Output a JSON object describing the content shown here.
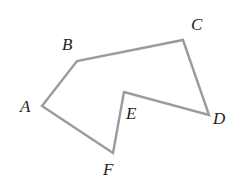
{
  "figure": {
    "type": "polygon",
    "vertex_order": [
      "A",
      "B",
      "C",
      "D",
      "E",
      "F"
    ],
    "vertices": [
      {
        "id": "A",
        "label": "A"
      },
      {
        "id": "B",
        "label": "B"
      },
      {
        "id": "C",
        "label": "C"
      },
      {
        "id": "D",
        "label": "D"
      },
      {
        "id": "E",
        "label": "E"
      },
      {
        "id": "F",
        "label": "F"
      }
    ],
    "edges": [
      [
        "A",
        "B"
      ],
      [
        "B",
        "C"
      ],
      [
        "C",
        "D"
      ],
      [
        "D",
        "E"
      ],
      [
        "E",
        "F"
      ],
      [
        "F",
        "A"
      ]
    ],
    "colors": {
      "edge": "#9b9b9b",
      "label": "#222222",
      "background": "#ffffff"
    }
  }
}
